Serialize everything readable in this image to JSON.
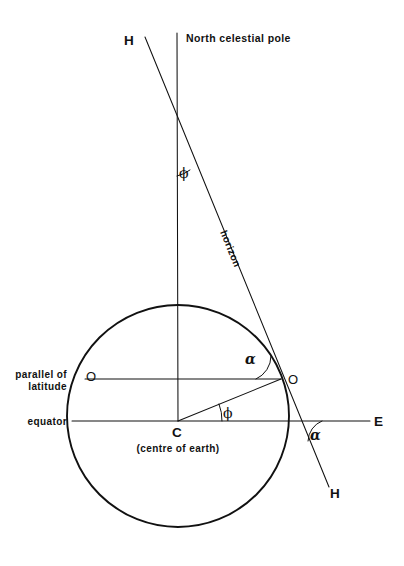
{
  "figure": {
    "background_color": "#ffffff",
    "ink_color": "#111111"
  },
  "labels": {
    "h_top": "H",
    "h_bottom": "H",
    "north_celestial_pole": "North celestial pole",
    "horizon": "horizon",
    "parallel_of_latitude_line1": "parallel of",
    "parallel_of_latitude_line2": "latitude",
    "equator": "equator",
    "east": "E",
    "observer_left": "O",
    "observer_right": "O",
    "centre_point": "C",
    "centre_caption": "(centre of earth)",
    "angle_phi_top": "ϕ",
    "angle_phi_centre": "ϕ",
    "angle_alpha_upper": "α",
    "angle_alpha_lower": "α"
  },
  "geometry": {
    "polar_axis": {
      "x": 177,
      "y_top": 33,
      "y_bottom": 421
    },
    "earth_circle": {
      "cx": 178,
      "cy": 416,
      "r": 111
    },
    "horizon_line": {
      "x1": 145,
      "y1": 37,
      "x2": 329,
      "y2": 487
    },
    "equator_line": {
      "x1": 72,
      "y": 421,
      "x2": 370
    },
    "parallel_line": {
      "x1": 85,
      "y": 379,
      "x2": 281
    },
    "radius_to_observer": {
      "x1": 178,
      "y1": 421,
      "x2": 281,
      "y2": 379
    },
    "observer_point": {
      "x": 281,
      "y": 379
    },
    "horizon_equator_intersection": {
      "x": 300,
      "y": 421
    }
  },
  "angles": {
    "phi_top_deg": 18,
    "phi_centre_deg": 22,
    "alpha_upper_deg": 68,
    "alpha_lower_deg": 68
  }
}
